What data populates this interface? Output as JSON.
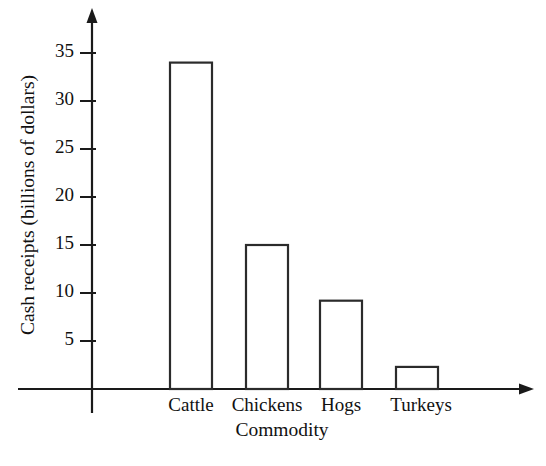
{
  "chart_data": {
    "type": "bar",
    "title": "",
    "xlabel": "Commodity",
    "ylabel": "Cash receipts (billions of dollars)",
    "categories": [
      "Cattle",
      "Chickens",
      "Hogs",
      "Turkeys"
    ],
    "values": [
      34,
      15,
      9.2,
      2.3
    ],
    "series": [
      {
        "name": "Cash receipts",
        "values": [
          34,
          15,
          9.2,
          2.3
        ]
      }
    ],
    "yticks": [
      5,
      10,
      15,
      20,
      25,
      30,
      35
    ],
    "ytick_labels": [
      "5",
      "10",
      "15",
      "20",
      "25",
      "30",
      "35"
    ],
    "ylim": [
      0,
      37
    ],
    "grid": false,
    "legend": false,
    "legend_position": "none",
    "bar_style": {
      "fill": "#ffffff",
      "edge_color": "#2b2b2b",
      "edge_width": 2.2
    },
    "axis_style": {
      "color": "#1a1a1a",
      "arrow_heads": true,
      "y_axis_extends_below_origin": true
    }
  },
  "axes": {
    "y_axis_title": "Cash receipts (billions of dollars)",
    "x_axis_title": "Commodity"
  },
  "ticks": {
    "y": [
      {
        "label": "35",
        "value": 35
      },
      {
        "label": "30",
        "value": 30
      },
      {
        "label": "25",
        "value": 25
      },
      {
        "label": "20",
        "value": 20
      },
      {
        "label": "15",
        "value": 15
      },
      {
        "label": "10",
        "value": 10
      },
      {
        "label": "5",
        "value": 5
      }
    ]
  },
  "bars": [
    {
      "label": "Cattle",
      "value": 34
    },
    {
      "label": "Chickens",
      "value": 15
    },
    {
      "label": "Hogs",
      "value": 9.2
    },
    {
      "label": "Turkeys",
      "value": 2.3
    }
  ]
}
